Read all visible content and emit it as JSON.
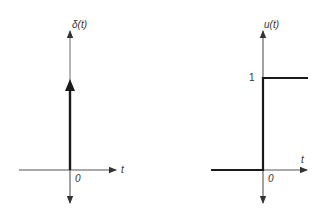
{
  "diagrams": [
    {
      "name": "unit-impulse",
      "y_label": "δ(t)",
      "x_label": "t",
      "origin_label": "0",
      "description": "Unit impulse at t = 0"
    },
    {
      "name": "unit-step",
      "y_label": "u(t)",
      "x_label": "t",
      "origin_label": "0",
      "level_label": "1",
      "description": "Unit step: 0 for t < 0, 1 for t >= 0"
    }
  ],
  "colors": {
    "axis": "#444444",
    "signal": "#1a1a1a",
    "text": "#333333",
    "background": "#ffffff"
  }
}
